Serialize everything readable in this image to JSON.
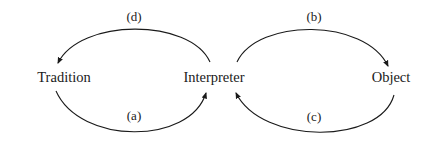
{
  "diagram": {
    "type": "cycle-diagram",
    "nodes": [
      {
        "id": "tradition",
        "label": "Tradition",
        "x": 64,
        "y": 77
      },
      {
        "id": "interpreter",
        "label": "Interpreter",
        "x": 214,
        "y": 77
      },
      {
        "id": "object",
        "label": "Object",
        "x": 391,
        "y": 77
      }
    ],
    "edges": [
      {
        "id": "a",
        "label": "(a)",
        "from": "tradition",
        "to": "interpreter",
        "label_x": 134,
        "label_y": 116
      },
      {
        "id": "b",
        "label": "(b)",
        "from": "interpreter",
        "to": "object",
        "label_x": 314,
        "label_y": 17
      },
      {
        "id": "c",
        "label": "(c)",
        "from": "object",
        "to": "interpreter",
        "label_x": 314,
        "label_y": 117
      },
      {
        "id": "d",
        "label": "(d)",
        "from": "interpreter",
        "to": "tradition",
        "label_x": 134,
        "label_y": 17
      }
    ],
    "colors": {
      "background": "#ffffff",
      "stroke": "#1a1a1a",
      "text": "#1a1a1a"
    }
  }
}
